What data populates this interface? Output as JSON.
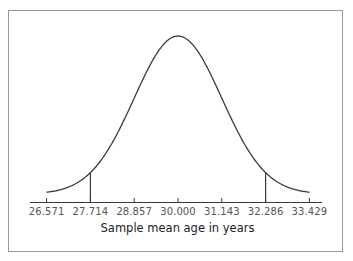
{
  "chart_data": {
    "type": "line",
    "title": "",
    "subtitle": "Normal sampling distribution of the sample mean",
    "xlabel": "Sample mean age in years",
    "ylabel": "",
    "x_ticks": [
      26.571,
      27.714,
      28.857,
      30.0,
      31.143,
      32.286,
      33.429
    ],
    "x_tick_labels": [
      "26.571",
      "27.714",
      "28.857",
      "30.000",
      "31.143",
      "32.286",
      "33.429"
    ],
    "xlim": [
      26.0,
      34.0
    ],
    "grid": false,
    "legend": null,
    "series": [
      {
        "name": "Normal density",
        "distribution": "normal",
        "mean": 30.0,
        "sd": 1.143,
        "x_range": [
          26.571,
          33.429
        ]
      }
    ],
    "reference_lines": [
      {
        "x": 27.714,
        "orientation": "vertical",
        "label": "mean - 2 SE"
      },
      {
        "x": 32.286,
        "orientation": "vertical",
        "label": "mean + 2 SE"
      }
    ]
  },
  "colors": {
    "curve": "#3a3a3a",
    "axis": "#3a3a3a",
    "frame": "#9a9a9a",
    "tick_text": "#555555"
  }
}
